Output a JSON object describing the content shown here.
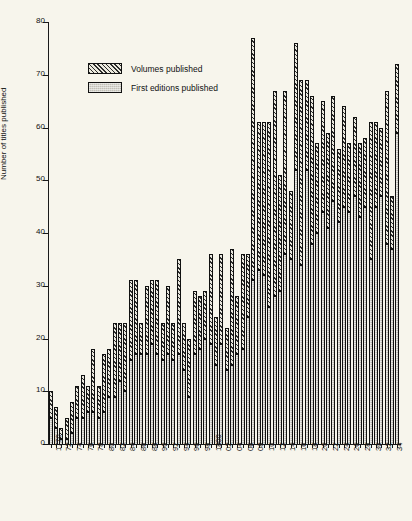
{
  "chart_data": {
    "type": "bar",
    "subtype": "stacked-bar",
    "title": "",
    "xlabel": "",
    "ylabel": "Number of titles published",
    "ylim": [
      0,
      80
    ],
    "yticks": [
      0,
      10,
      20,
      30,
      40,
      50,
      60,
      70,
      80
    ],
    "grid": false,
    "legend_position": "upper-left-inside",
    "x_tick_label_rotation": -90,
    "x_tick_label_interval": 2,
    "categories": [
      "1770",
      "1771",
      "1772",
      "1773",
      "1774",
      "1775",
      "1776",
      "1777",
      "1778",
      "1779",
      "1780",
      "1781",
      "1782",
      "1783",
      "1784",
      "1785",
      "1786",
      "1787",
      "1788",
      "1789",
      "1790",
      "1791",
      "1792",
      "1793",
      "1794",
      "1795",
      "1796",
      "1797",
      "1798",
      "1799",
      "1800",
      "1801",
      "1802",
      "1803",
      "1804",
      "1805",
      "1806",
      "1807",
      "1808",
      "1809",
      "1810",
      "1811",
      "1812",
      "1813",
      "1814",
      "1815",
      "1816",
      "1817",
      "1818",
      "1819",
      "1820",
      "1821",
      "1822",
      "1823",
      "1824",
      "1825",
      "1826",
      "1827",
      "1828",
      "1829",
      "1830",
      "1831",
      "1832",
      "1833",
      "1834",
      "1835"
    ],
    "tick_labels": [
      "1770",
      "",
      "72",
      "",
      "74",
      "",
      "76",
      "",
      "78",
      "",
      "80",
      "",
      "82",
      "",
      "84",
      "",
      "86",
      "",
      "88",
      "",
      "90",
      "",
      "92",
      "",
      "94",
      "",
      "96",
      "",
      "98",
      "",
      "1800",
      "",
      "02",
      "",
      "04",
      "",
      "06",
      "",
      "08",
      "",
      "10",
      "",
      "12",
      "",
      "14",
      "",
      "16",
      "",
      "18",
      "",
      "20",
      "",
      "22",
      "",
      "24",
      "",
      "26",
      "",
      "28",
      "",
      "30",
      "",
      "32",
      "",
      "34",
      ""
    ],
    "series": [
      {
        "name": "First editions published",
        "fill": "solid-gray",
        "color": "#b8b6ad",
        "values": [
          5,
          3,
          1,
          1,
          2,
          5,
          5,
          6,
          6,
          5,
          6,
          9,
          9,
          12,
          10,
          16,
          17,
          17,
          17,
          19,
          17,
          16,
          17,
          16,
          17,
          14,
          9,
          17,
          18,
          20,
          19,
          15,
          19,
          14,
          15,
          17,
          18,
          24,
          31,
          33,
          32,
          26,
          28,
          29,
          36,
          35,
          52,
          34,
          52,
          38,
          40,
          44,
          41,
          46,
          42,
          45,
          44,
          47,
          43,
          45,
          35,
          45,
          47,
          38,
          37,
          59
        ]
      },
      {
        "name": "Volumes published",
        "fill": "diagonal-hatch",
        "color": "#2b2b2b",
        "values": [
          5,
          4,
          2,
          4,
          6,
          6,
          8,
          5,
          12,
          6,
          11,
          9,
          14,
          11,
          13,
          15,
          14,
          6,
          13,
          12,
          14,
          7,
          13,
          7,
          18,
          9,
          11,
          12,
          10,
          9,
          17,
          9,
          17,
          8,
          22,
          11,
          18,
          12,
          46,
          28,
          29,
          35,
          39,
          22,
          31,
          13,
          24,
          35,
          17,
          28,
          17,
          21,
          18,
          20,
          14,
          19,
          13,
          15,
          14,
          13,
          26,
          16,
          13,
          29,
          10,
          13
        ]
      }
    ],
    "totals": [
      10,
      7,
      3,
      5,
      8,
      11,
      13,
      11,
      18,
      11,
      17,
      18,
      23,
      23,
      23,
      31,
      31,
      23,
      30,
      31,
      31,
      23,
      30,
      23,
      35,
      23,
      20,
      29,
      28,
      29,
      36,
      24,
      36,
      22,
      37,
      28,
      36,
      36,
      77,
      61,
      61,
      61,
      67,
      51,
      67,
      48,
      76,
      69,
      69,
      66,
      57,
      65,
      59,
      66,
      56,
      64,
      57,
      62,
      57,
      58,
      61,
      61,
      60,
      67,
      47,
      72
    ]
  },
  "legend": {
    "items": [
      {
        "label": "Volumes published",
        "swatch": "hatched-swatch"
      },
      {
        "label": "First editions published",
        "swatch": "gray-swatch"
      }
    ]
  },
  "colors": {
    "background": "#f7f5ec",
    "axis": "#1a1a1a",
    "first_editions": "#b8b6ad",
    "volumes_hatch": "#2b2b2b"
  }
}
